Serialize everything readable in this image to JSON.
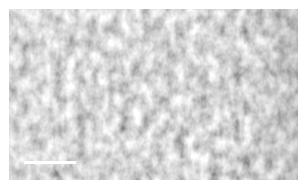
{
  "image": {
    "description": "Grayscale micrograph with mottled granular texture",
    "base_color": "#c8c8c8",
    "light_color": "#e6e6e6",
    "dark_color": "#9a9a9a"
  },
  "scale_bar": {
    "label": "",
    "color": "#ffffff",
    "x": 15,
    "y": 152,
    "width": 52
  }
}
